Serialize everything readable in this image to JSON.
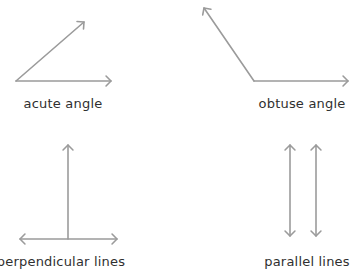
{
  "colors": {
    "stroke": "#9b9b9b",
    "text": "#2f2f2f",
    "background": "#ffffff"
  },
  "figures": [
    {
      "id": "acute",
      "label": "acute angle",
      "label_pos": [
        63,
        96
      ],
      "segments": [
        {
          "from": [
            16,
            81
          ],
          "to": [
            111,
            81
          ],
          "arrow_end": true
        },
        {
          "from": [
            16,
            81
          ],
          "to": [
            84,
            22
          ],
          "arrow_end": true
        }
      ]
    },
    {
      "id": "obtuse",
      "label": "obtuse angle",
      "label_pos": [
        302,
        96
      ],
      "segments": [
        {
          "from": [
            254,
            81
          ],
          "to": [
            348,
            81
          ],
          "arrow_end": true
        },
        {
          "from": [
            254,
            81
          ],
          "to": [
            204,
            8
          ],
          "arrow_end": true
        }
      ]
    },
    {
      "id": "perpendicular",
      "label": "perpendicular lines",
      "label_pos": [
        61,
        254
      ],
      "segments": [
        {
          "from": [
            68,
            239
          ],
          "to": [
            68,
            145
          ],
          "arrow_end": true
        },
        {
          "from": [
            20,
            239
          ],
          "to": [
            117,
            239
          ],
          "arrow_start": true,
          "arrow_end": true
        }
      ]
    },
    {
      "id": "parallel",
      "label": "parallel lines",
      "label_pos": [
        307,
        254
      ],
      "segments": [
        {
          "from": [
            290,
            145
          ],
          "to": [
            290,
            236
          ],
          "arrow_start": true,
          "arrow_end": true
        },
        {
          "from": [
            316,
            145
          ],
          "to": [
            316,
            236
          ],
          "arrow_start": true,
          "arrow_end": true
        }
      ]
    }
  ]
}
